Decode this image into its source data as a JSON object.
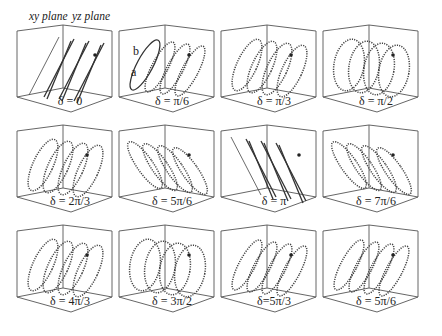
{
  "figure": {
    "plane_labels": {
      "xy": "xy plane",
      "yz": "yz plane"
    },
    "axis_labels": {
      "b": "b",
      "a": "a"
    },
    "panels": [
      {
        "id": 0,
        "label": "δ = 0",
        "shape": "line"
      },
      {
        "id": 1,
        "label": "δ = π/6",
        "shape": "ellipse"
      },
      {
        "id": 2,
        "label": "δ = π/3",
        "shape": "ellipse"
      },
      {
        "id": 3,
        "label": "δ = π/2",
        "shape": "circle"
      },
      {
        "id": 4,
        "label": "δ = 2π/3",
        "shape": "ellipse"
      },
      {
        "id": 5,
        "label": "δ = 5π/6",
        "shape": "ellipse"
      },
      {
        "id": 6,
        "label": "δ = π",
        "shape": "line"
      },
      {
        "id": 7,
        "label": "δ = 7π/6",
        "shape": "ellipse"
      },
      {
        "id": 8,
        "label": "δ = 4π/3",
        "shape": "ellipse"
      },
      {
        "id": 9,
        "label": "δ = 3π/2",
        "shape": "circle"
      },
      {
        "id": 10,
        "label": "δ=5π/3",
        "shape": "ellipse"
      },
      {
        "id": 11,
        "label": "δ = 5π/6",
        "shape": "ellipse"
      }
    ]
  }
}
